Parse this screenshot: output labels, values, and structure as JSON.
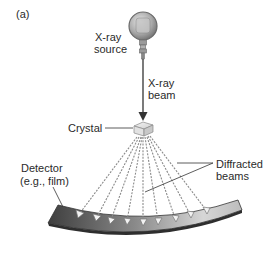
{
  "figure": {
    "panel_label": "(a)",
    "source_label_line1": "X-ray",
    "source_label_line2": "source",
    "beam_label_line1": "X-ray",
    "beam_label_line2": "beam",
    "crystal_label": "Crystal",
    "detector_label_line1": "Detector",
    "detector_label_line2": "(e.g., film)",
    "diffracted_label_line1": "Diffracted",
    "diffracted_label_line2": "beams",
    "diffracted_beam_count": 9
  },
  "colors": {
    "text": "#2a2a2a",
    "detector_dark": "#4a4a4a",
    "detector_light": "#d8d8d8",
    "source_body": "#a8a8a8",
    "beam": "#333333"
  }
}
